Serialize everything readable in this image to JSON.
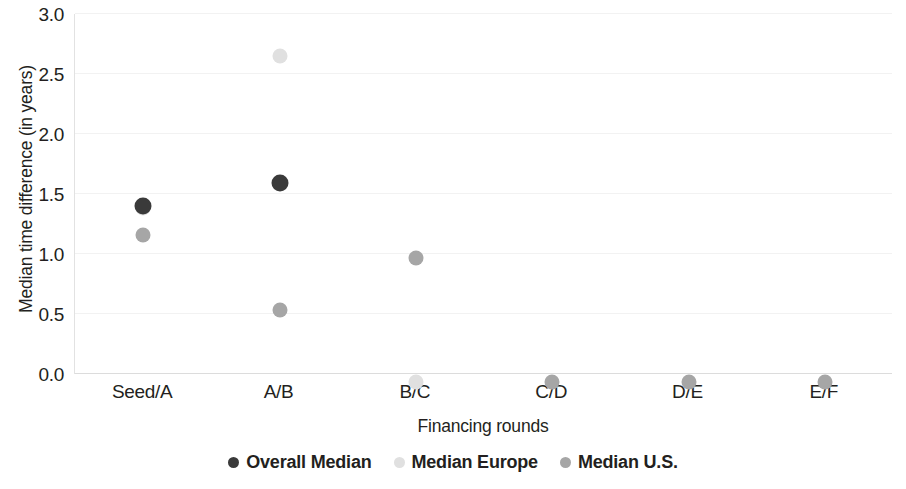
{
  "chart_data": {
    "type": "scatter",
    "title": "",
    "xlabel": "Financing rounds",
    "ylabel": "Median time difference (in years)",
    "categories": [
      "Seed/A",
      "A/B",
      "B/C",
      "C/D",
      "D/E",
      "E/F"
    ],
    "ylim": [
      0.0,
      3.0
    ],
    "yticks": [
      "0.0",
      "0.5",
      "1.0",
      "1.5",
      "2.0",
      "2.5",
      "3.0"
    ],
    "ytick_values": [
      0.0,
      0.5,
      1.0,
      1.5,
      2.0,
      2.5,
      3.0
    ],
    "grid": true,
    "legend_position": "bottom",
    "series": [
      {
        "name": "Overall Median",
        "color": "#3a3a3a",
        "values": [
          1.47,
          1.66,
          null,
          null,
          null,
          null
        ]
      },
      {
        "name": "Median Europe",
        "color": "#e0e0e0",
        "values": [
          1.45,
          2.71,
          0.0,
          null,
          null,
          null
        ]
      },
      {
        "name": "Median U.S.",
        "color": "#a6a6a6",
        "values": [
          1.22,
          0.6,
          1.03,
          0.0,
          0.0,
          0.0
        ]
      }
    ]
  }
}
